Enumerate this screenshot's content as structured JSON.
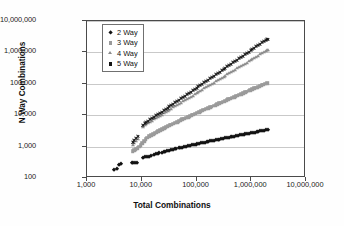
{
  "chart_data": {
    "type": "scatter",
    "title": "",
    "xlabel": "Total Combinations",
    "ylabel": "N Way Combinations",
    "xscale": "log",
    "yscale": "log",
    "xlim": [
      1000,
      10000000
    ],
    "ylim": [
      100,
      10000000
    ],
    "grid": true,
    "legend_position": "top-left-inside",
    "xticklabels": [
      "1,000",
      "10,000",
      "100,000",
      "1,000,000",
      "10,000,000"
    ],
    "xtickvalues": [
      1000,
      10000,
      100000,
      1000000,
      10000000
    ],
    "yticklabels": [
      "100",
      "1,000",
      "10,000",
      "100,000",
      "1,000,000",
      "10,000,000"
    ],
    "ytickvalues": [
      100,
      1000,
      10000,
      100000,
      1000000,
      10000000
    ],
    "series": [
      {
        "name": "2 Way",
        "marker": "diamond",
        "color": "#121212",
        "points": [
          [
            3100,
            180
          ],
          [
            3500,
            195
          ],
          [
            3900,
            265
          ],
          [
            4200,
            270
          ],
          [
            6500,
            290
          ],
          [
            7000,
            295
          ],
          [
            7600,
            300
          ],
          [
            8200,
            305
          ],
          [
            10500,
            430
          ],
          [
            11500,
            450
          ],
          [
            12500,
            470
          ],
          [
            13500,
            480
          ],
          [
            15000,
            520
          ],
          [
            16500,
            545
          ],
          [
            18000,
            570
          ],
          [
            19500,
            590
          ],
          [
            21000,
            610
          ],
          [
            23000,
            640
          ],
          [
            25000,
            665
          ],
          [
            27000,
            690
          ],
          [
            29000,
            710
          ],
          [
            31000,
            735
          ],
          [
            34000,
            760
          ],
          [
            37000,
            790
          ],
          [
            40000,
            820
          ],
          [
            43000,
            845
          ],
          [
            47000,
            875
          ],
          [
            51000,
            905
          ],
          [
            55000,
            930
          ],
          [
            60000,
            965
          ],
          [
            65000,
            995
          ],
          [
            70000,
            1025
          ],
          [
            76000,
            1060
          ],
          [
            82000,
            1090
          ],
          [
            89000,
            1125
          ],
          [
            96000,
            1155
          ],
          [
            104000,
            1190
          ],
          [
            112000,
            1225
          ],
          [
            121000,
            1260
          ],
          [
            131000,
            1300
          ],
          [
            141000,
            1335
          ],
          [
            153000,
            1375
          ],
          [
            165000,
            1415
          ],
          [
            178000,
            1455
          ],
          [
            193000,
            1500
          ],
          [
            208000,
            1540
          ],
          [
            225000,
            1585
          ],
          [
            243000,
            1630
          ],
          [
            263000,
            1675
          ],
          [
            284000,
            1720
          ],
          [
            307000,
            1770
          ],
          [
            332000,
            1820
          ],
          [
            359000,
            1870
          ],
          [
            388000,
            1920
          ],
          [
            419000,
            1975
          ],
          [
            453000,
            2030
          ],
          [
            490000,
            2085
          ],
          [
            530000,
            2140
          ],
          [
            573000,
            2200
          ],
          [
            619000,
            2260
          ],
          [
            669000,
            2320
          ],
          [
            723000,
            2385
          ],
          [
            782000,
            2450
          ],
          [
            845000,
            2515
          ],
          [
            914000,
            2585
          ],
          [
            988000,
            2655
          ],
          [
            1068000,
            2725
          ],
          [
            1155000,
            2800
          ],
          [
            1249000,
            2875
          ],
          [
            1350000,
            2950
          ],
          [
            1460000,
            3030
          ],
          [
            1578000,
            3110
          ],
          [
            1706000,
            3190
          ],
          [
            1845000,
            3270
          ],
          [
            1995000,
            3350
          ]
        ]
      },
      {
        "name": "3 Way",
        "marker": "square",
        "color": "#9a9a9a",
        "points": [
          [
            6800,
            700
          ],
          [
            7200,
            760
          ],
          [
            7800,
            820
          ],
          [
            8400,
            900
          ],
          [
            9000,
            1000
          ],
          [
            9600,
            1120
          ],
          [
            10300,
            1300
          ],
          [
            11000,
            1500
          ],
          [
            11800,
            1700
          ],
          [
            12700,
            1900
          ],
          [
            13700,
            2100
          ],
          [
            14800,
            2300
          ],
          [
            16000,
            2500
          ],
          [
            17300,
            2700
          ],
          [
            18700,
            2900
          ],
          [
            20200,
            3100
          ],
          [
            21800,
            3350
          ],
          [
            23600,
            3600
          ],
          [
            25500,
            3850
          ],
          [
            27600,
            4100
          ],
          [
            29800,
            4400
          ],
          [
            32200,
            4700
          ],
          [
            34800,
            5000
          ],
          [
            37600,
            5350
          ],
          [
            40600,
            5700
          ],
          [
            43900,
            6050
          ],
          [
            47400,
            6450
          ],
          [
            51200,
            6850
          ],
          [
            55300,
            7300
          ],
          [
            59800,
            7750
          ],
          [
            64600,
            8250
          ],
          [
            69800,
            8750
          ],
          [
            75400,
            9300
          ],
          [
            81500,
            9900
          ],
          [
            88000,
            10500
          ],
          [
            95100,
            11150
          ],
          [
            102800,
            11850
          ],
          [
            111000,
            12600
          ],
          [
            120000,
            13350
          ],
          [
            129600,
            14150
          ],
          [
            140000,
            15000
          ],
          [
            151300,
            15900
          ],
          [
            163400,
            16850
          ],
          [
            176600,
            17850
          ],
          [
            190800,
            18900
          ],
          [
            206100,
            20050
          ],
          [
            222700,
            21250
          ],
          [
            240600,
            22500
          ],
          [
            260000,
            23850
          ],
          [
            280900,
            25250
          ],
          [
            303500,
            26750
          ],
          [
            327900,
            28350
          ],
          [
            354200,
            30000
          ],
          [
            382700,
            31800
          ],
          [
            413500,
            33700
          ],
          [
            446700,
            35700
          ],
          [
            482600,
            37800
          ],
          [
            521400,
            40000
          ],
          [
            563300,
            42400
          ],
          [
            608600,
            44900
          ],
          [
            657500,
            47500
          ],
          [
            710400,
            50300
          ],
          [
            767500,
            53300
          ],
          [
            829200,
            56400
          ],
          [
            895800,
            59700
          ],
          [
            967800,
            63200
          ],
          [
            1045600,
            66900
          ],
          [
            1129700,
            70900
          ],
          [
            1220500,
            75000
          ],
          [
            1318600,
            79400
          ],
          [
            1424600,
            84100
          ],
          [
            1539100,
            89000
          ],
          [
            1662800,
            94300
          ],
          [
            1796500,
            99800
          ],
          [
            1940900,
            105700
          ]
        ]
      },
      {
        "name": "4 Way",
        "marker": "triangle",
        "color": "#8c8c8c",
        "points": [
          [
            6800,
            1150
          ],
          [
            7300,
            1350
          ],
          [
            7900,
            1550
          ],
          [
            8500,
            1750
          ],
          [
            10500,
            4300
          ],
          [
            11300,
            4700
          ],
          [
            12200,
            5100
          ],
          [
            13200,
            5600
          ],
          [
            14300,
            6100
          ],
          [
            15500,
            6700
          ],
          [
            16800,
            7300
          ],
          [
            18200,
            8000
          ],
          [
            19700,
            8700
          ],
          [
            21400,
            9500
          ],
          [
            23200,
            10400
          ],
          [
            25200,
            11400
          ],
          [
            27300,
            12400
          ],
          [
            29600,
            13600
          ],
          [
            32100,
            14800
          ],
          [
            34800,
            16200
          ],
          [
            37800,
            17700
          ],
          [
            41000,
            19300
          ],
          [
            44500,
            21100
          ],
          [
            48200,
            23000
          ],
          [
            52300,
            25100
          ],
          [
            56700,
            27400
          ],
          [
            61500,
            29900
          ],
          [
            66700,
            32600
          ],
          [
            72400,
            35600
          ],
          [
            78500,
            38800
          ],
          [
            85100,
            42300
          ],
          [
            92300,
            46100
          ],
          [
            100100,
            50300
          ],
          [
            108600,
            54900
          ],
          [
            117800,
            59800
          ],
          [
            127700,
            65200
          ],
          [
            138500,
            71100
          ],
          [
            150200,
            77500
          ],
          [
            162900,
            84500
          ],
          [
            176700,
            92100
          ],
          [
            191600,
            100400
          ],
          [
            207800,
            109500
          ],
          [
            225400,
            119400
          ],
          [
            244400,
            130100
          ],
          [
            265000,
            141800
          ],
          [
            287400,
            154600
          ],
          [
            311700,
            168500
          ],
          [
            338000,
            183700
          ],
          [
            366600,
            200200
          ],
          [
            397500,
            218300
          ],
          [
            431100,
            238000
          ],
          [
            467500,
            259400
          ],
          [
            507000,
            282800
          ],
          [
            549800,
            308300
          ],
          [
            596200,
            336100
          ],
          [
            646600,
            366400
          ],
          [
            701200,
            399400
          ],
          [
            760400,
            435400
          ],
          [
            824700,
            474600
          ],
          [
            894300,
            517400
          ],
          [
            969800,
            564000
          ],
          [
            1051700,
            614800
          ],
          [
            1140500,
            670200
          ],
          [
            1236800,
            730600
          ],
          [
            1341200,
            796400
          ],
          [
            1454500,
            868100
          ],
          [
            1577300,
            946300
          ],
          [
            1710500,
            1031500
          ],
          [
            1854900,
            1124400
          ],
          [
            1911400,
            1170000
          ],
          [
            1995000,
            1230000
          ]
        ]
      },
      {
        "name": "5 Way",
        "marker": "x",
        "color": "#141414",
        "points": [
          [
            6800,
            1400
          ],
          [
            7300,
            1600
          ],
          [
            7900,
            1850
          ],
          [
            8500,
            2100
          ],
          [
            10500,
            4900
          ],
          [
            11300,
            5400
          ],
          [
            12200,
            5900
          ],
          [
            13200,
            6500
          ],
          [
            14300,
            7200
          ],
          [
            15500,
            7900
          ],
          [
            16800,
            8700
          ],
          [
            18200,
            9600
          ],
          [
            19700,
            10500
          ],
          [
            21400,
            11600
          ],
          [
            23200,
            12800
          ],
          [
            25200,
            14100
          ],
          [
            27300,
            15500
          ],
          [
            29600,
            17100
          ],
          [
            32100,
            18800
          ],
          [
            34800,
            20700
          ],
          [
            37800,
            22800
          ],
          [
            41000,
            25100
          ],
          [
            44500,
            27700
          ],
          [
            48200,
            30500
          ],
          [
            52300,
            33600
          ],
          [
            56700,
            37000
          ],
          [
            61500,
            40800
          ],
          [
            66700,
            45000
          ],
          [
            72400,
            49600
          ],
          [
            78500,
            54700
          ],
          [
            85100,
            60300
          ],
          [
            92300,
            66500
          ],
          [
            100100,
            73300
          ],
          [
            108600,
            80800
          ],
          [
            117800,
            89100
          ],
          [
            127700,
            98300
          ],
          [
            138500,
            108400
          ],
          [
            150200,
            119500
          ],
          [
            162900,
            131800
          ],
          [
            176700,
            145400
          ],
          [
            191600,
            160300
          ],
          [
            207800,
            176800
          ],
          [
            225400,
            195000
          ],
          [
            244400,
            215000
          ],
          [
            265000,
            237100
          ],
          [
            287400,
            261500
          ],
          [
            311700,
            288400
          ],
          [
            338000,
            318000
          ],
          [
            366600,
            350700
          ],
          [
            397500,
            386800
          ],
          [
            431100,
            426500
          ],
          [
            467500,
            470300
          ],
          [
            507000,
            518600
          ],
          [
            549800,
            571900
          ],
          [
            596200,
            630700
          ],
          [
            646600,
            695500
          ],
          [
            701200,
            766900
          ],
          [
            760400,
            845700
          ],
          [
            824700,
            932600
          ],
          [
            894300,
            1028400
          ],
          [
            969800,
            1134100
          ],
          [
            1051700,
            1250600
          ],
          [
            1140500,
            1379100
          ],
          [
            1236800,
            1520800
          ],
          [
            1341200,
            1677000
          ],
          [
            1454500,
            1849300
          ],
          [
            1577300,
            2039300
          ],
          [
            1710500,
            2248800
          ],
          [
            1854900,
            2479900
          ],
          [
            1930000,
            2600000
          ],
          [
            1995000,
            2700000
          ]
        ]
      }
    ]
  }
}
